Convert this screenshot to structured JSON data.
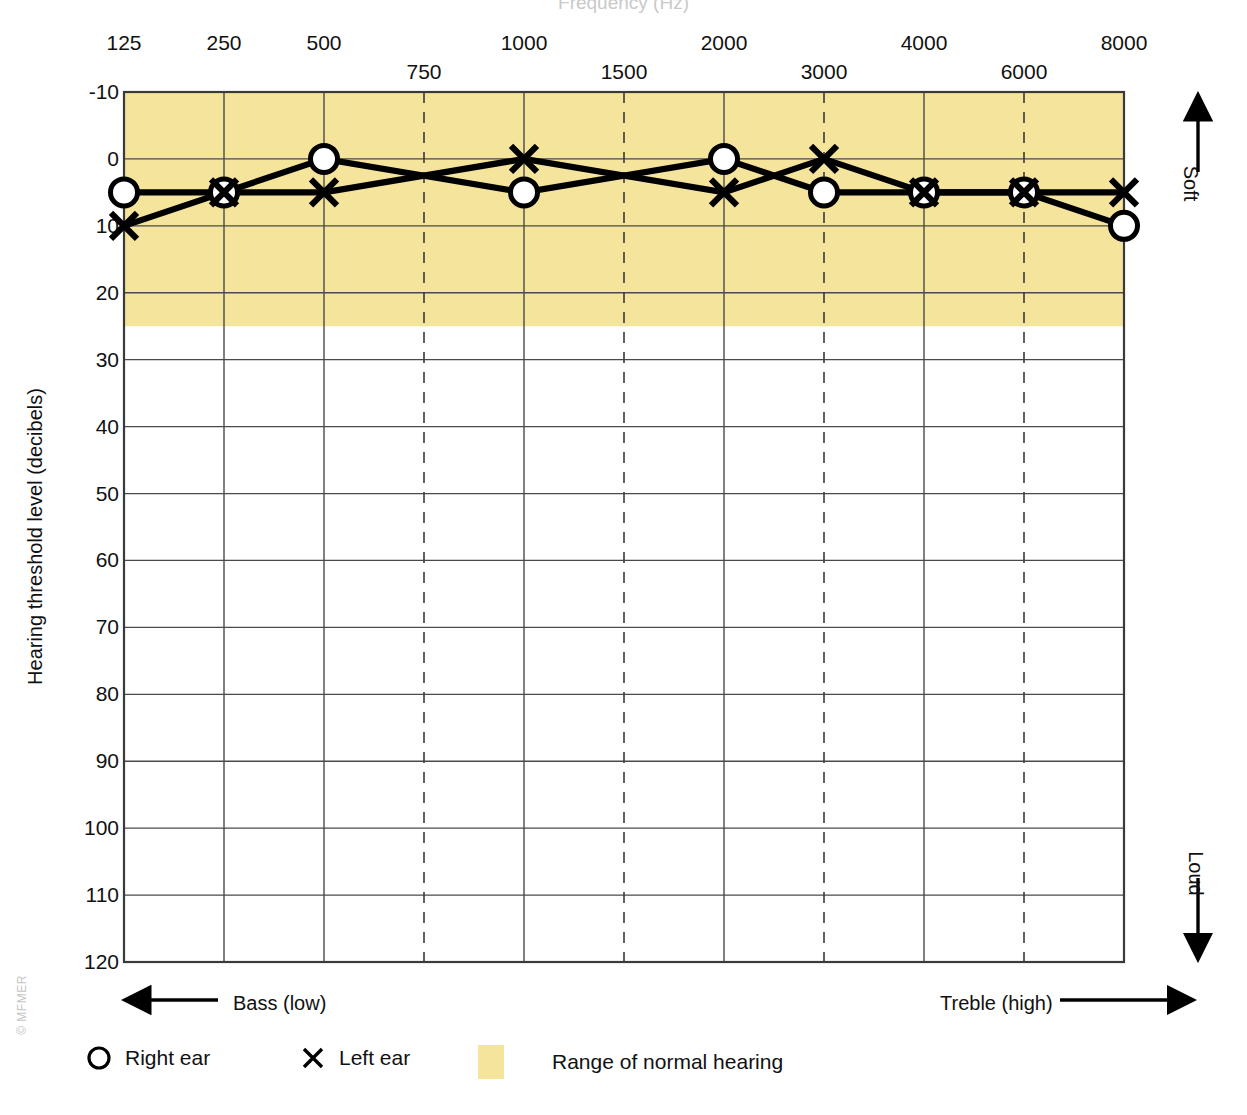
{
  "chart_data": {
    "type": "line",
    "title": "Frequency (Hz)",
    "xlabel": "",
    "ylabel": "Hearing threshold level (decibels)",
    "x_tick_labels_main": [
      "125",
      "250",
      "500",
      "1000",
      "2000",
      "4000",
      "8000"
    ],
    "x_tick_labels_interoctave": [
      "750",
      "1500",
      "3000",
      "6000"
    ],
    "x_frequencies": [
      125,
      250,
      500,
      750,
      1000,
      1500,
      2000,
      3000,
      4000,
      6000,
      8000
    ],
    "y_tick_labels": [
      "-10",
      "0",
      "10",
      "20",
      "30",
      "40",
      "50",
      "60",
      "70",
      "80",
      "90",
      "100",
      "110",
      "120"
    ],
    "ylim": [
      -10,
      120
    ],
    "grid": true,
    "legend_position": "bottom-left",
    "normal_range": {
      "from_db": -10,
      "to_db": 25,
      "color": "#f5e49c",
      "label": "Range of normal hearing"
    },
    "series": [
      {
        "name": "Right ear",
        "marker": "circle",
        "points": [
          {
            "frequency": 125,
            "db": 5
          },
          {
            "frequency": 250,
            "db": 5
          },
          {
            "frequency": 500,
            "db": 0
          },
          {
            "frequency": 1000,
            "db": 5
          },
          {
            "frequency": 2000,
            "db": 0
          },
          {
            "frequency": 3000,
            "db": 5
          },
          {
            "frequency": 4000,
            "db": 5
          },
          {
            "frequency": 6000,
            "db": 5
          },
          {
            "frequency": 8000,
            "db": 10
          }
        ]
      },
      {
        "name": "Left ear",
        "marker": "x",
        "points": [
          {
            "frequency": 125,
            "db": 10
          },
          {
            "frequency": 250,
            "db": 5
          },
          {
            "frequency": 500,
            "db": 5
          },
          {
            "frequency": 1000,
            "db": 0
          },
          {
            "frequency": 2000,
            "db": 5
          },
          {
            "frequency": 3000,
            "db": 0
          },
          {
            "frequency": 4000,
            "db": 5
          },
          {
            "frequency": 6000,
            "db": 5
          },
          {
            "frequency": 8000,
            "db": 5
          }
        ]
      }
    ],
    "annotations": {
      "soft": "Soft",
      "loud": "Loud",
      "bass": "Bass (low)",
      "treble": "Treble (high)"
    }
  },
  "axes": {
    "title": "Frequency (Hz)",
    "y_title": "Hearing threshold level (decibels)",
    "ticks_main": [
      {
        "label": "125",
        "freq": 125
      },
      {
        "label": "250",
        "freq": 250
      },
      {
        "label": "500",
        "freq": 500
      },
      {
        "label": "1000",
        "freq": 1000
      },
      {
        "label": "2000",
        "freq": 2000
      },
      {
        "label": "4000",
        "freq": 4000
      },
      {
        "label": "8000",
        "freq": 8000
      }
    ],
    "ticks_interoctave": [
      {
        "label": "750",
        "freq": 750
      },
      {
        "label": "1500",
        "freq": 1500
      },
      {
        "label": "3000",
        "freq": 3000
      },
      {
        "label": "6000",
        "freq": 6000
      }
    ],
    "db_ticks": [
      "-10",
      "0",
      "10",
      "20",
      "30",
      "40",
      "50",
      "60",
      "70",
      "80",
      "90",
      "100",
      "110",
      "120"
    ]
  },
  "direction_labels": {
    "soft": "Soft",
    "loud": "Loud",
    "bass": "Bass (low)",
    "treble": "Treble (high)"
  },
  "legend": {
    "right_ear": "Right ear",
    "left_ear": "Left ear",
    "normal_range": "Range of normal hearing"
  },
  "credit": "© MFMER",
  "colors": {
    "normal_band": "#f5e49c",
    "grid": "#555555",
    "plot_line": "#000000",
    "text": "#111111"
  }
}
